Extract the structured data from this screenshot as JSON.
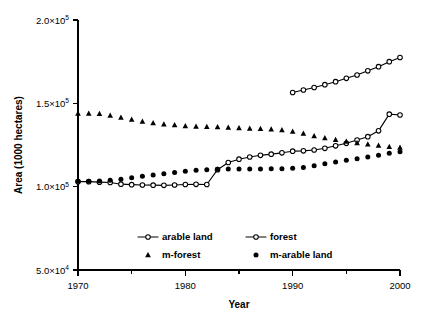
{
  "chart_data": {
    "type": "line",
    "title": "",
    "xlabel": "Year",
    "ylabel": "Area (1000 hectares)",
    "xlim": [
      1970,
      2000
    ],
    "ylim": [
      50000,
      200000
    ],
    "grid": false,
    "legend_position": "inside-bottom-center",
    "xticks": [
      1970,
      1975,
      1980,
      1985,
      1990,
      1995,
      2000
    ],
    "xtick_labels": [
      "1970",
      "",
      "1980",
      "",
      "1990",
      "",
      "2000"
    ],
    "yticks": [
      50000,
      100000,
      150000,
      200000
    ],
    "ytick_labels": [
      "5.0×10",
      "1.0×10",
      "1.5×10",
      "2.0×10"
    ],
    "ytick_exponents": [
      "4",
      "5",
      "5",
      "5"
    ],
    "series": [
      {
        "name": "arable land",
        "marker": "open-circle",
        "line": true,
        "x": [
          1970,
          1971,
          1972,
          1973,
          1974,
          1975,
          1976,
          1977,
          1978,
          1979,
          1980,
          1981,
          1982,
          1983,
          1984,
          1985,
          1986,
          1987,
          1988,
          1989,
          1990,
          1991,
          1992,
          1993,
          1994,
          1995,
          1996,
          1997,
          1998,
          1999,
          2000
        ],
        "values": [
          103000,
          103000,
          102700,
          102500,
          101500,
          101200,
          101000,
          100900,
          100800,
          101000,
          101300,
          101400,
          101300,
          110200,
          114500,
          116500,
          117800,
          118800,
          119500,
          120300,
          121300,
          121500,
          122000,
          123000,
          124500,
          126000,
          128000,
          130000,
          133500,
          143500,
          143000
        ]
      },
      {
        "name": "forest",
        "marker": "open-circle",
        "line": true,
        "x": [
          1990,
          1991,
          1992,
          1993,
          1994,
          1995,
          1996,
          1997,
          1998,
          1999,
          2000
        ],
        "values": [
          156500,
          158000,
          159500,
          161200,
          163000,
          165000,
          167000,
          169500,
          172000,
          175000,
          177500
        ]
      },
      {
        "name": "m-forest",
        "marker": "filled-triangle",
        "line": false,
        "x": [
          1970,
          1971,
          1972,
          1973,
          1974,
          1975,
          1976,
          1977,
          1978,
          1979,
          1980,
          1981,
          1982,
          1983,
          1984,
          1985,
          1986,
          1987,
          1988,
          1989,
          1990,
          1991,
          1992,
          1993,
          1994,
          1995,
          1996,
          1997,
          1998,
          1999,
          2000
        ],
        "values": [
          144000,
          144000,
          143800,
          142800,
          141500,
          140300,
          139200,
          138200,
          137500,
          137000,
          136500,
          136200,
          136000,
          135800,
          135500,
          135200,
          135000,
          134800,
          134500,
          134000,
          133200,
          132000,
          130500,
          129300,
          128200,
          127200,
          126300,
          125500,
          124800,
          124000,
          123500
        ]
      },
      {
        "name": "m-arable land",
        "marker": "filled-circle",
        "line": false,
        "x": [
          1970,
          1971,
          1972,
          1973,
          1974,
          1975,
          1976,
          1977,
          1978,
          1979,
          1980,
          1981,
          1982,
          1983,
          1984,
          1985,
          1986,
          1987,
          1988,
          1989,
          1990,
          1991,
          1992,
          1993,
          1994,
          1995,
          1996,
          1997,
          1998,
          1999,
          2000
        ],
        "values": [
          103200,
          103200,
          103400,
          103800,
          104500,
          105300,
          106200,
          107000,
          107800,
          108500,
          109200,
          109800,
          110200,
          110500,
          110600,
          110600,
          110600,
          110600,
          110700,
          110800,
          111000,
          111500,
          112500,
          113800,
          114800,
          115800,
          116800,
          117800,
          118800,
          120000,
          121000
        ]
      }
    ],
    "legend": [
      {
        "label": "arable land",
        "marker": "open-circle-line"
      },
      {
        "label": "forest",
        "marker": "open-circle-line"
      },
      {
        "label": "m-forest",
        "marker": "filled-triangle"
      },
      {
        "label": "m-arable land",
        "marker": "filled-circle"
      }
    ]
  }
}
